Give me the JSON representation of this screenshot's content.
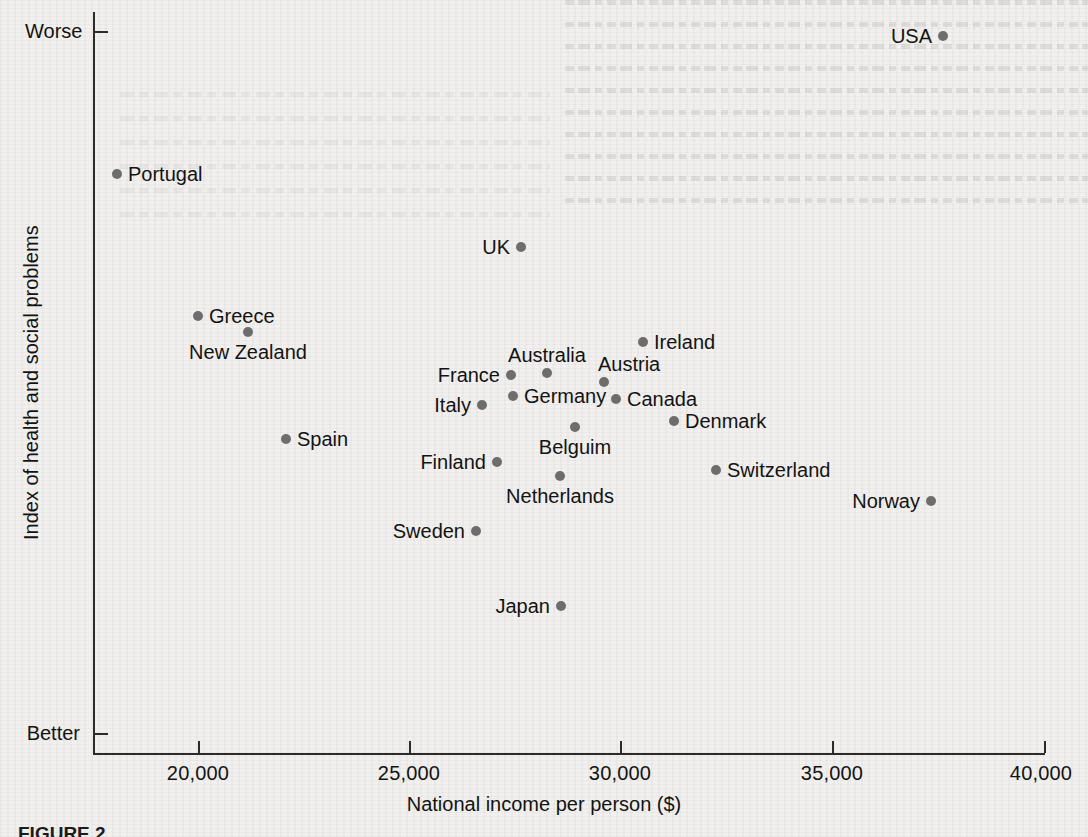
{
  "chart_data": {
    "type": "scatter",
    "title": "",
    "xlabel": "National income per person ($)",
    "ylabel": "Index of health and social problems",
    "xlim": [
      17500,
      40000
    ],
    "ylim_labels": [
      "Better",
      "Worse"
    ],
    "x_ticks": [
      "20,000",
      "25,000",
      "30,000",
      "35,000",
      "40,000"
    ],
    "x_tick_values": [
      20000,
      25000,
      30000,
      35000,
      40000
    ],
    "y_ticks": [
      "Worse",
      "Better"
    ],
    "grid": false,
    "legend": "none",
    "point_color": "#6d6d6d",
    "axis_color": "#2b2b2b",
    "background_color": "#f1f0ee",
    "points": [
      {
        "label": "USA",
        "x": 37500,
        "y": 3.2,
        "px": 943,
        "py": 36,
        "label_pos": "left"
      },
      {
        "label": "Portugal",
        "x": 17900,
        "y": 2.15,
        "px": 117,
        "py": 174,
        "label_pos": "right"
      },
      {
        "label": "UK",
        "x": 27600,
        "y": 1.6,
        "px": 521,
        "py": 247,
        "label_pos": "left"
      },
      {
        "label": "Greece",
        "x": 20000,
        "y": 1.05,
        "px": 198,
        "py": 316,
        "label_pos": "right"
      },
      {
        "label": "New Zealand",
        "x": 21200,
        "y": 0.93,
        "px": 248,
        "py": 332,
        "label_pos": "below"
      },
      {
        "label": "Ireland",
        "x": 30450,
        "y": 0.82,
        "px": 643,
        "py": 342,
        "label_pos": "right"
      },
      {
        "label": "Australia",
        "x": 28200,
        "y": 0.58,
        "px": 547,
        "py": 373,
        "label_pos": "above"
      },
      {
        "label": "France",
        "x": 27350,
        "y": 0.56,
        "px": 511,
        "py": 375,
        "label_pos": "left"
      },
      {
        "label": "Austria",
        "x": 29550,
        "y": 0.5,
        "px": 604,
        "py": 382,
        "label_pos": "above-right"
      },
      {
        "label": "Germany",
        "x": 27400,
        "y": 0.39,
        "px": 513,
        "py": 396,
        "label_pos": "right"
      },
      {
        "label": "Canada",
        "x": 29800,
        "y": 0.37,
        "px": 616,
        "py": 399,
        "label_pos": "right"
      },
      {
        "label": "Italy",
        "x": 26650,
        "y": 0.32,
        "px": 482,
        "py": 405,
        "label_pos": "left"
      },
      {
        "label": "Denmark",
        "x": 31200,
        "y": 0.21,
        "px": 674,
        "py": 421,
        "label_pos": "right"
      },
      {
        "label": "Spain",
        "x": 22100,
        "y": 0.07,
        "px": 286,
        "py": 439,
        "label_pos": "right"
      },
      {
        "label": "Belguim",
        "x": 28800,
        "y": -0.02,
        "px": 575,
        "py": 427,
        "label_pos": "below"
      },
      {
        "label": "Finland",
        "x": 27050,
        "y": -0.24,
        "px": 497,
        "py": 462,
        "label_pos": "left"
      },
      {
        "label": "Switzerland",
        "x": 32200,
        "y": -0.31,
        "px": 716,
        "py": 470,
        "label_pos": "right"
      },
      {
        "label": "Netherlands",
        "x": 28500,
        "y": -0.4,
        "px": 560,
        "py": 476,
        "label_pos": "below"
      },
      {
        "label": "Norway",
        "x": 37200,
        "y": -0.55,
        "px": 931,
        "py": 501,
        "label_pos": "left"
      },
      {
        "label": "Sweden",
        "x": 26500,
        "y": -0.76,
        "px": 476,
        "py": 531,
        "label_pos": "left"
      },
      {
        "label": "Japan",
        "x": 28500,
        "y": -1.3,
        "px": 561,
        "py": 606,
        "label_pos": "left"
      }
    ]
  },
  "axes": {
    "x_title": "National income per person ($)",
    "y_title": "Index of health and social problems",
    "y_top_label": "Worse",
    "y_bottom_label": "Better",
    "x_tick_labels": [
      "20,000",
      "25,000",
      "30,000",
      "35,000",
      "40,000"
    ]
  },
  "caption": {
    "text": "FIGURE 2"
  }
}
